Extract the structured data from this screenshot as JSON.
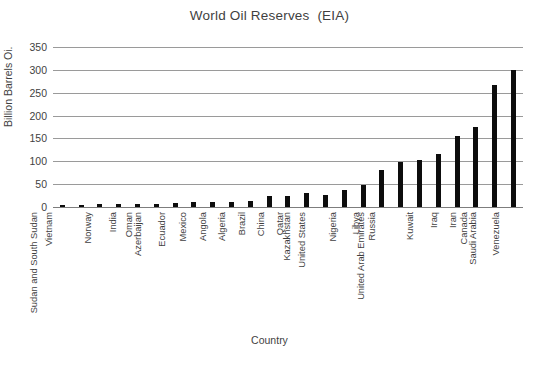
{
  "chart_data": {
    "type": "bar",
    "title": "World Oil Reserves  (EIA)",
    "xlabel": "Country",
    "ylabel": "Billion Barrels Oi.",
    "ylim": [
      0,
      350
    ],
    "ytick_step": 50,
    "yticks": [
      "350",
      "300",
      "250",
      "200",
      "150",
      "100",
      "50",
      "0"
    ],
    "grid": true,
    "legend": "none",
    "bar_color": "#0d0d0d",
    "categories": [
      "Vietnam",
      "Sudan and South Sudan",
      "Norway",
      "India",
      "Oman",
      "Azerbaijan",
      "Ecuador",
      "Mexico",
      "Angola",
      "Algeria",
      "Brazil",
      "China",
      "Qatar",
      "Kazakhstan",
      "United States",
      "Nigeria",
      "Libya",
      "Russia",
      "United Arab Emirates",
      "Kuwait",
      "Iraq",
      "Iran",
      "Canada",
      "Saudi Arabia",
      "Venezuela"
    ],
    "values": [
      4,
      5,
      6,
      6,
      6,
      7,
      8,
      10,
      10,
      12,
      13,
      24,
      25,
      30,
      26,
      37,
      48,
      80,
      98,
      102,
      115,
      155,
      175,
      268,
      300
    ]
  }
}
